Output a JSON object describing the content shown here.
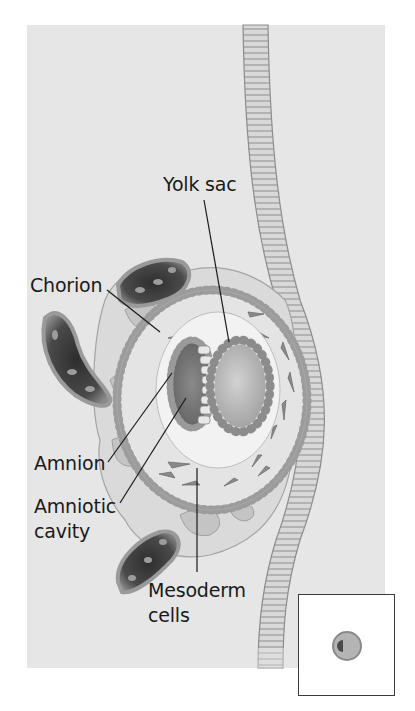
{
  "figure": {
    "labels": {
      "yolk_sac": "Yolk sac",
      "chorion": "Chorion",
      "amnion": "Amnion",
      "amniotic_cavity_line1": "Amniotic",
      "amniotic_cavity_line2": "cavity",
      "mesoderm_line1": "Mesoderm",
      "mesoderm_line2": "cells"
    },
    "inset": {
      "description": "Actual-size blastocyst view"
    },
    "colors": {
      "background_panel": "#e6e6e6",
      "page": "#ffffff",
      "tissue_light": "#d4d4d4",
      "tissue_mid": "#a8a8a8",
      "tissue_dark": "#6e6e6e",
      "vessel_dark": "#3a3a3a",
      "label_text": "#1a1a1a"
    }
  }
}
